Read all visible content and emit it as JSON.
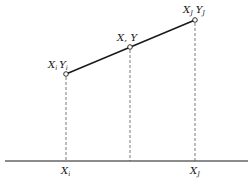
{
  "diagram": {
    "points": [
      {
        "id": "i",
        "label_x": "X",
        "sub_x": "i",
        "label_y": "Y",
        "sub_y": "i",
        "cx": 66,
        "cy": 74
      },
      {
        "id": "mid",
        "label": "X, Y",
        "cx": 130,
        "cy": 47
      },
      {
        "id": "j",
        "label_x": "X",
        "sub_x": "J",
        "label_y": "Y",
        "sub_y": "J",
        "cx": 195,
        "cy": 20
      }
    ],
    "axis_labels": [
      {
        "main": "X",
        "sub": "i",
        "x": 66
      },
      {
        "main": "X",
        "sub": "J",
        "x": 195
      }
    ],
    "colors": {
      "line": "#1a1a1a",
      "dash": "#555555",
      "background": "#ffffff"
    }
  }
}
